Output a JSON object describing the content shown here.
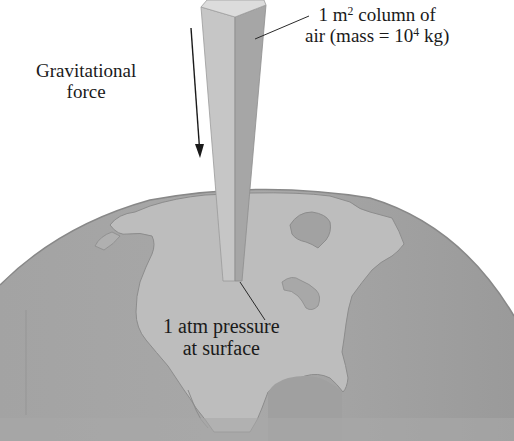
{
  "diagram": {
    "labels": {
      "column": {
        "line1_prefix": "1 m",
        "line1_sup": "2",
        "line1_suffix": " column of",
        "line2_prefix": "air (mass = 10",
        "line2_sup": "4",
        "line2_suffix": " kg)"
      },
      "gravity": {
        "line1": "Gravitational",
        "line2": "force"
      },
      "surface": {
        "line1": "1 atm pressure",
        "line2": "at surface"
      }
    },
    "colors": {
      "background": "#ffffff",
      "ocean": "#9c9c9c",
      "land": "#bcbcbc",
      "coast": "#8a8a8a",
      "column_left_face": "#c4c4c4",
      "column_right_face": "#a2a2a2",
      "column_top": "#dadada",
      "text": "#1a1a1a"
    }
  }
}
